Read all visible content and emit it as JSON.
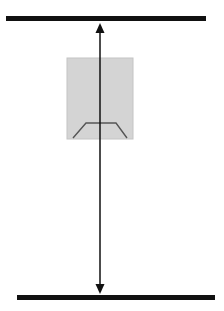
{
  "diagram": {
    "type": "vertical-distance-illustration",
    "canvas": {
      "width": 224,
      "height": 311,
      "background": "#ffffff"
    },
    "top_bar": {
      "x1": 6,
      "x2": 206,
      "y": 18,
      "thickness": 5,
      "color": "#111111"
    },
    "bottom_bar": {
      "x1": 17,
      "x2": 215,
      "y": 297,
      "thickness": 5,
      "color": "#111111"
    },
    "object_box": {
      "x": 67,
      "y": 58,
      "width": 66,
      "height": 81,
      "fill": "#d4d4d4",
      "stroke": "#bdbdbd"
    },
    "trapezoid": {
      "points": "73,138 86,123 116,123 127,138",
      "stroke": "#555555"
    },
    "arrow": {
      "x": 100,
      "y1": 24,
      "y2": 293,
      "color": "#111111",
      "heads": [
        "up",
        "down"
      ]
    },
    "labels": []
  }
}
